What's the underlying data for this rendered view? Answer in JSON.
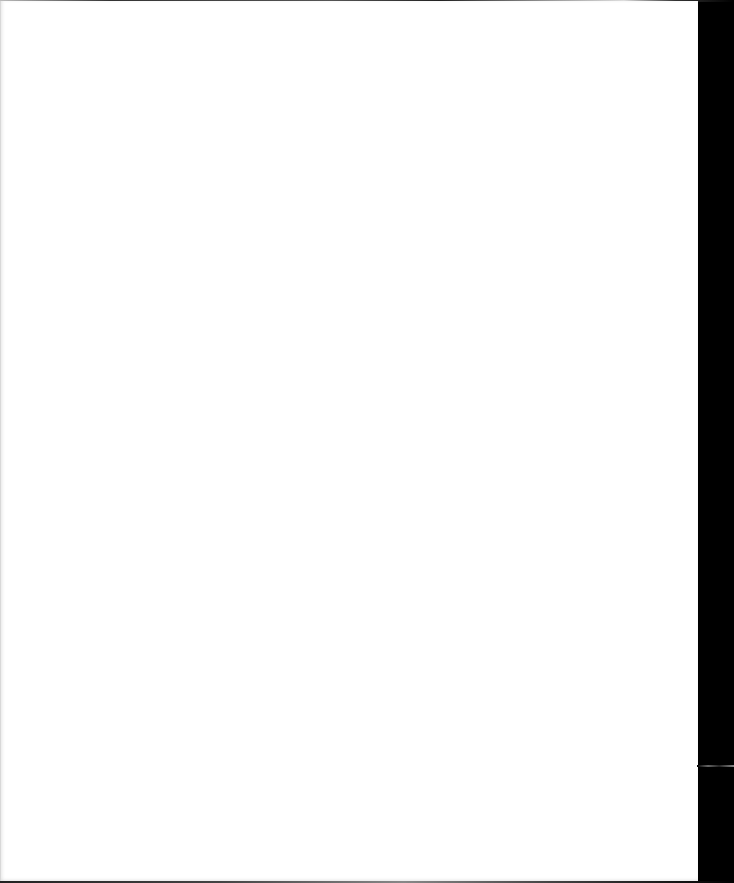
{
  "document": {
    "type": "scanned-blank-page",
    "text": "",
    "colors": {
      "paper": "#ffffff",
      "scanner_background": "#000000"
    }
  }
}
